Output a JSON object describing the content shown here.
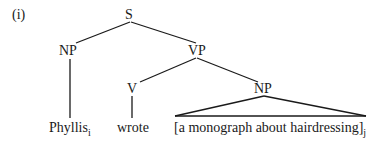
{
  "example_label": "(i)",
  "tree": {
    "root": "S",
    "subject_np": "NP",
    "vp": "VP",
    "verb": "V",
    "object_np": "NP",
    "leaves": {
      "subject": {
        "text": "Phyllis",
        "index": "i"
      },
      "verb": {
        "text": "wrote"
      },
      "object": {
        "text": "[a monograph about hairdressing]",
        "index": "j"
      }
    }
  }
}
